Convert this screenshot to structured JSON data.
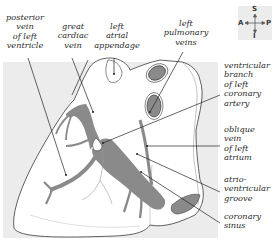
{
  "figure": {
    "type": "anatomical illustration",
    "colors": {
      "background_panel": "#ececec",
      "heart_fill": "#ffffff",
      "vein_fill": "#8a8a8a",
      "outline": "#3a3a3a",
      "leader_line": "#222222",
      "label_text": "#2a2a2a"
    }
  },
  "labels": {
    "posterior_vein_left_ventricle": "posterior\nvein\nof left\nventricle",
    "great_cardiac_vein": "great\ncardiac\nvein",
    "left_atrial_appendage": "left\natrial\nappendage",
    "left_pulmonary_veins": "left\npulmonary\nveins",
    "ventricular_branch_left_coronary_artery": "ventricular\nbranch\nof left\ncoronary\nartery",
    "oblique_vein_left_atrium": "oblique\nvein\nof left\natrium",
    "atrioventricular_groove": "atrio-\nventricular\ngroove",
    "coronary_sinus": "coronary\nsinus"
  },
  "compass": {
    "superior": "S",
    "inferior": "I",
    "anterior": "A",
    "posterior": "P"
  }
}
